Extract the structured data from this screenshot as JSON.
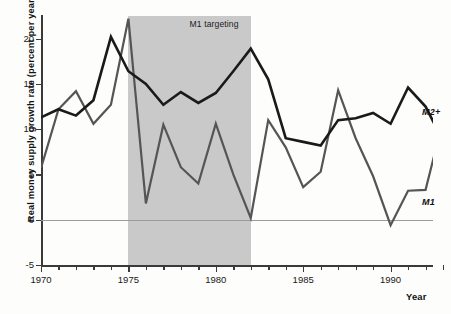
{
  "chart_data": {
    "type": "line",
    "title": "",
    "xlabel": "Year",
    "ylabel": "Real money supply growth rate (percent per year)",
    "xlim": [
      1970,
      1993
    ],
    "ylim": [
      -5,
      22.5
    ],
    "yticks": [
      -5,
      0,
      5,
      10,
      15,
      20
    ],
    "ytick_labels": [
      "-5",
      "0",
      "5",
      "10",
      "15",
      "20"
    ],
    "xticks": [
      1970,
      1975,
      1980,
      1985,
      1990
    ],
    "xtick_labels": [
      "1970",
      "1975",
      "1980",
      "1985",
      "1990"
    ],
    "xminor_step": 1,
    "grid": false,
    "zero_line": true,
    "legend_position": "inline-annotations",
    "x": [
      1970,
      1971,
      1972,
      1973,
      1974,
      1975,
      1976,
      1977,
      1978,
      1979,
      1980,
      1981,
      1982,
      1983,
      1984,
      1985,
      1986,
      1987,
      1988,
      1989,
      1990,
      1991,
      1992,
      1993
    ],
    "series": [
      {
        "name": "M2+",
        "color": "#1a1a1a",
        "width": 2.6,
        "label": "M2+",
        "values": [
          11.3,
          12.2,
          11.5,
          13.2,
          20.2,
          16.4,
          15.0,
          12.7,
          14.1,
          12.9,
          14.0,
          16.4,
          18.9,
          15.5,
          9.0,
          8.6,
          8.2,
          11.0,
          11.2,
          11.8,
          10.6,
          14.6,
          12.5,
          8.7
        ]
      },
      {
        "name": "M1",
        "color": "#555555",
        "width": 2.2,
        "label": "M1",
        "values": [
          5.7,
          12.2,
          14.2,
          10.6,
          12.7,
          22.2,
          1.8,
          10.5,
          5.8,
          4.0,
          10.6,
          5.0,
          0.2,
          11.0,
          8.0,
          3.6,
          5.3,
          14.3,
          9.0,
          4.8,
          -0.6,
          3.2,
          3.3,
          11.0
        ]
      }
    ],
    "m2plus_tail": {
      "x": [
        1993,
        1994,
        1995
      ],
      "values": [
        8.7,
        5.8,
        4.5
      ]
    },
    "m1_tail": {
      "x": [
        1993,
        1994,
        1995
      ],
      "values": [
        11.0,
        3.3,
        3.3
      ]
    },
    "shaded_regions": [
      {
        "label": "M1 targeting",
        "x_start": 1975,
        "x_end": 1982,
        "color": "#c9c9c9"
      }
    ],
    "annotations": [
      {
        "text": "M1 targeting",
        "x": 1978.5,
        "y": 21.5
      },
      {
        "text": "M2+",
        "x": 1991.8,
        "y": 11.8
      },
      {
        "text": "M1",
        "x": 1991.8,
        "y": 1.9
      }
    ]
  }
}
